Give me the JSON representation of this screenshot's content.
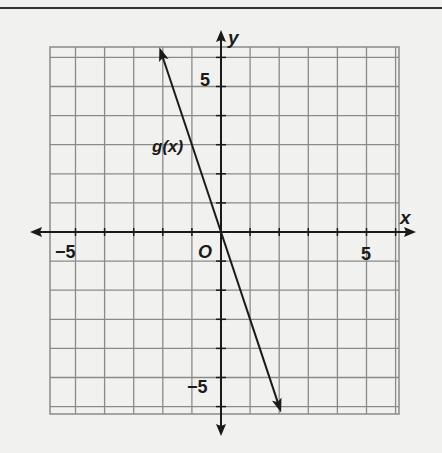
{
  "chart_data": {
    "type": "line",
    "title": "",
    "xlabel": "x",
    "ylabel": "y",
    "xlim": [
      -6,
      6
    ],
    "ylim": [
      -6,
      6
    ],
    "grid": true,
    "origin_label": "O",
    "tick_labels": {
      "x": [
        "-5",
        "5"
      ],
      "y": [
        "5",
        "-5"
      ]
    },
    "series": [
      {
        "name": "g(x)",
        "equation": "g(x) = -3x",
        "slope": -3,
        "intercept": 0,
        "x": [
          -2,
          -1,
          0,
          1,
          2
        ],
        "values": [
          6,
          3,
          0,
          -3,
          -6
        ]
      }
    ],
    "annotations": [
      {
        "text": "g(x)",
        "x": -2.3,
        "y": 3.2
      }
    ]
  },
  "labels": {
    "x_axis": "x",
    "y_axis": "y",
    "origin": "O",
    "x_neg5": "−5",
    "x_pos5": "5",
    "y_pos5": "5",
    "y_neg5": "−5",
    "series_label": "g(x)"
  }
}
